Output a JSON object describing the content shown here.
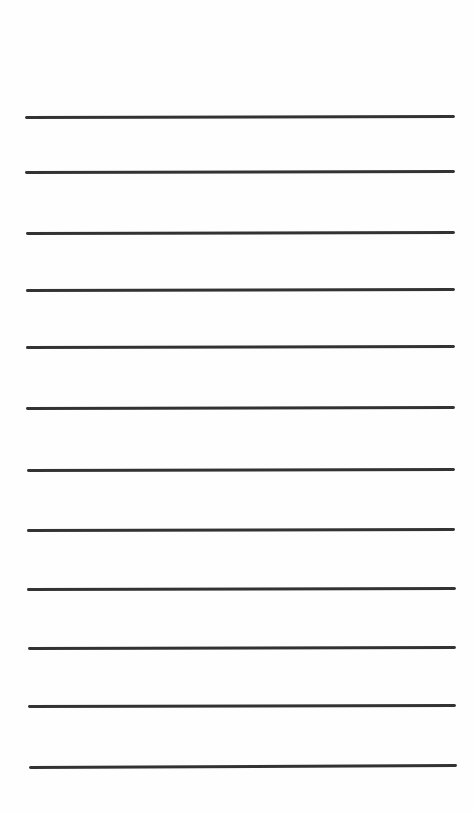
{
  "sheet": {
    "type": "lined-paper",
    "background": "#fefefe",
    "line_color": "#333333",
    "line_thickness_px": 3,
    "lines": [
      {
        "x1": 25,
        "y1": 117,
        "x2": 455,
        "y2": 116
      },
      {
        "x1": 25,
        "y1": 172,
        "x2": 455,
        "y2": 171
      },
      {
        "x1": 26,
        "y1": 233,
        "x2": 455,
        "y2": 232
      },
      {
        "x1": 26,
        "y1": 290,
        "x2": 455,
        "y2": 289
      },
      {
        "x1": 26,
        "y1": 347,
        "x2": 455,
        "y2": 346
      },
      {
        "x1": 26,
        "y1": 408,
        "x2": 455,
        "y2": 407
      },
      {
        "x1": 27,
        "y1": 470,
        "x2": 455,
        "y2": 469
      },
      {
        "x1": 27,
        "y1": 530,
        "x2": 455,
        "y2": 529
      },
      {
        "x1": 27,
        "y1": 589,
        "x2": 456,
        "y2": 588
      },
      {
        "x1": 28,
        "y1": 648,
        "x2": 456,
        "y2": 647
      },
      {
        "x1": 28,
        "y1": 706,
        "x2": 456,
        "y2": 705
      },
      {
        "x1": 29,
        "y1": 767,
        "x2": 457,
        "y2": 765
      }
    ]
  }
}
